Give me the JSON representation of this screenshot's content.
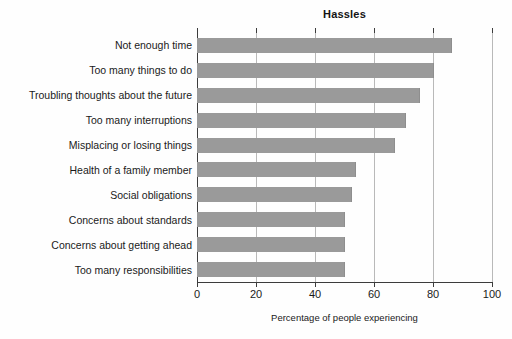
{
  "chart_data": {
    "type": "bar",
    "orientation": "horizontal",
    "title": "Hassles",
    "xlabel": "Percentage of people experiencing",
    "ylabel": "",
    "xlim": [
      0,
      100
    ],
    "xticks": [
      0,
      20,
      40,
      60,
      80,
      100
    ],
    "xtick_labels": [
      "0",
      "20",
      "40",
      "60",
      "80",
      "100"
    ],
    "grid": "vertical",
    "legend": "none",
    "bar_color": "#9a9a9a",
    "categories": [
      "Not enough time",
      "Too many things to do",
      "Troubling thoughts about the future",
      "Too many interruptions",
      "Misplacing or losing things",
      "Health of a family member",
      "Social obligations",
      "Concerns about standards",
      "Concerns about getting ahead",
      "Too many responsibilities"
    ],
    "values": [
      86.5,
      80.5,
      75.5,
      71,
      67,
      54,
      52.5,
      50,
      50,
      50
    ]
  },
  "axis": {
    "title": "Hassles",
    "x_label": "Percentage of people experiencing"
  }
}
